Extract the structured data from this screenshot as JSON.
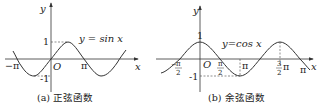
{
  "figure_a": {
    "y_axis_label": "y",
    "x_axis_label": "x",
    "origin_label": "O",
    "tick_one": "1",
    "tick_neg_one": "-1",
    "tick_neg_pi": "−π",
    "tick_pi": "π",
    "function_label": "y = sin x",
    "caption": "(a) 正弦函数"
  },
  "figure_b": {
    "y_axis_label": "y",
    "x_axis_label": "x",
    "origin_label": "O",
    "tick_one": "1",
    "tick_neg_one": "-1",
    "tick_neg_half_pi_num": "π",
    "tick_neg_half_pi_den": "2",
    "tick_neg_half_pi_sign": "−",
    "tick_half_pi_num": "π",
    "tick_half_pi_den": "2",
    "tick_pi": "π",
    "tick_three_half_num": "3",
    "tick_three_half_den": "2",
    "tick_three_half_pi": "π",
    "tick_two_pi": "π",
    "function_label": "y=cos x",
    "caption": "(b) 余弦函数"
  }
}
